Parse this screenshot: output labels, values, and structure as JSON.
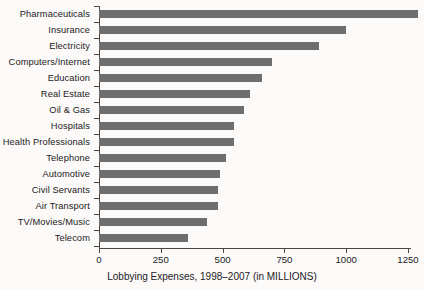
{
  "chart_data": {
    "type": "bar",
    "orientation": "horizontal",
    "title": "Lobbying Expenses, 1998–2007 (in MILLIONS)",
    "xlabel": "Lobbying Expenses, 1998–2007 (in MILLIONS)",
    "ylabel": "",
    "categories": [
      "Pharmaceuticals",
      "Insurance",
      "Electricity",
      "Computers/Internet",
      "Education",
      "Real Estate",
      "Oil & Gas",
      "Hospitals",
      "Health Professionals",
      "Telephone",
      "Automotive",
      "Civil Servants",
      "Air Transport",
      "TV/Movies/Music",
      "Telecom"
    ],
    "values": [
      1290,
      1000,
      890,
      700,
      660,
      610,
      585,
      545,
      545,
      515,
      490,
      480,
      480,
      435,
      360
    ],
    "xlim": [
      0,
      1290
    ],
    "xticks": [
      0,
      250,
      500,
      750,
      1000,
      1250
    ],
    "xticklabels": [
      "0",
      "250",
      "500",
      "750",
      "1000",
      "1250"
    ],
    "grid": false,
    "legend": false,
    "bar_color": "#6e6e6e",
    "axis_color": "#4a4642",
    "background_color": "#fbfaf8"
  }
}
